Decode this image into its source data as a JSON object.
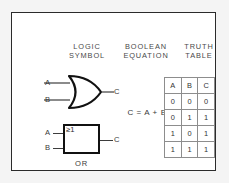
{
  "figure": {
    "background_color": "#f4f4f4",
    "card_color": "#ffffff",
    "border_color": "#2b2b2b"
  },
  "headings": {
    "logic_symbol": "LOGIC\nSYMBOL",
    "boolean_equation": "BOOLEAN\nEQUATION",
    "truth_table": "TRUTH\nTABLE"
  },
  "distinctive_symbol": {
    "input_a": "A",
    "input_b": "B",
    "output_c": "C",
    "shape": "or-gate-distinctive"
  },
  "equation": {
    "text": "C = A + B"
  },
  "iec_symbol": {
    "input_a": "A",
    "input_b": "B",
    "output_c": "C",
    "qualifier": "≥1",
    "caption": "OR"
  },
  "truth_table": {
    "columns": [
      "A",
      "B",
      "C"
    ],
    "rows": [
      [
        "0",
        "0",
        "0"
      ],
      [
        "0",
        "1",
        "1"
      ],
      [
        "1",
        "0",
        "1"
      ],
      [
        "1",
        "1",
        "1"
      ]
    ]
  }
}
